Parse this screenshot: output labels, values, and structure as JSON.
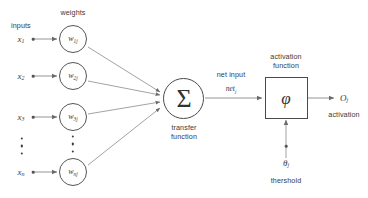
{
  "diagram": {
    "background_color": "#ffffff",
    "stroke_color": "#555555",
    "text_color": "#3a3a3a"
  },
  "headers": {
    "inputs": "inputs",
    "weights": "weights"
  },
  "inputs": [
    {
      "label": "x",
      "sub": "1"
    },
    {
      "label": "x",
      "sub": "2"
    },
    {
      "label": "x",
      "sub": "3"
    },
    {
      "label": "x",
      "sub": "n"
    }
  ],
  "weights": [
    {
      "label": "w",
      "sub": "1j"
    },
    {
      "label": "w",
      "sub": "2j"
    },
    {
      "label": "w",
      "sub": "3j"
    },
    {
      "label": "w",
      "sub": "nj"
    }
  ],
  "ellipsis": {
    "inputs_dots": "⋮",
    "weights_dots": "⋮"
  },
  "transfer": {
    "symbol": "Σ",
    "caption_line1": "transfer",
    "caption_line2": "function"
  },
  "net_input": {
    "caption": "net input",
    "symbol": "net",
    "sub": "j"
  },
  "activation_function": {
    "caption_line1": "activation",
    "caption_line2": "function",
    "symbol": "φ"
  },
  "threshold": {
    "symbol": "θ",
    "sub": "j",
    "caption": "thershold"
  },
  "output": {
    "symbol": "O",
    "sub": "j",
    "caption": "activation"
  }
}
